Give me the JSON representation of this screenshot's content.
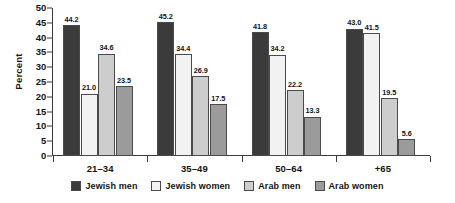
{
  "chart_data": {
    "type": "bar",
    "title": "",
    "xlabel": "",
    "ylabel": "Percent",
    "ylim": [
      0,
      50
    ],
    "ytick_step": 5,
    "yticks": [
      "50",
      "45",
      "40",
      "35",
      "30",
      "25",
      "20",
      "15",
      "10",
      "5",
      "0"
    ],
    "grid": false,
    "legend_position": "bottom",
    "categories": [
      "21–34",
      "35–49",
      "50–64",
      "+65"
    ],
    "series": [
      {
        "name": "Jewish men",
        "color": "#3b3b3b",
        "values": [
          44.2,
          45.2,
          41.8,
          43.0
        ],
        "labels": [
          "44.2",
          "45.2",
          "41.8",
          "43.0"
        ]
      },
      {
        "name": "Jewish women",
        "color": "#f2f2f2",
        "values": [
          21.0,
          34.4,
          34.2,
          41.5
        ],
        "labels": [
          "21.0",
          "34.4",
          "34.2",
          "41.5"
        ]
      },
      {
        "name": "Arab men",
        "color": "#cdcdcd",
        "values": [
          34.6,
          26.9,
          22.2,
          19.5
        ],
        "labels": [
          "34.6",
          "26.9",
          "22.2",
          "19.5"
        ]
      },
      {
        "name": "Arab women",
        "color": "#9b9b9b",
        "values": [
          23.5,
          17.5,
          13.3,
          5.6
        ],
        "labels": [
          "23.5",
          "17.5",
          "13.3",
          "5.6"
        ]
      }
    ]
  }
}
